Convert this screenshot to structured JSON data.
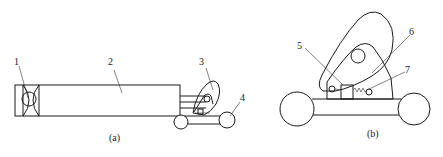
{
  "figure": {
    "subfigures": [
      {
        "caption": "(a)",
        "labels": [
          {
            "id": "1",
            "text": "1"
          },
          {
            "id": "2",
            "text": "2"
          },
          {
            "id": "3",
            "text": "3"
          },
          {
            "id": "4",
            "text": "4"
          }
        ]
      },
      {
        "caption": "(b)",
        "labels": [
          {
            "id": "5",
            "text": "5"
          },
          {
            "id": "6",
            "text": "6"
          },
          {
            "id": "7",
            "text": "7"
          }
        ]
      }
    ]
  }
}
